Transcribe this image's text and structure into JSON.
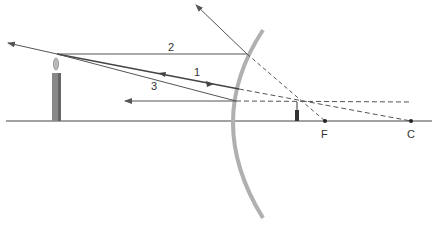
{
  "diagram": {
    "type": "convex-mirror-ray-diagram",
    "colors": {
      "ray": "#555555",
      "axis": "#444444",
      "dashed": "#555555",
      "mirror": "#aaaaaa",
      "candle": "#777777",
      "image": "#333333"
    },
    "ray_labels": [
      "2",
      "1",
      "3"
    ],
    "point_labels": {
      "focal_point": "F",
      "center_of_curvature": "C"
    }
  }
}
